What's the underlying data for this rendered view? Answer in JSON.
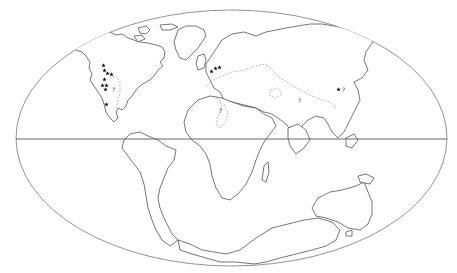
{
  "map": {
    "type": "paleogeographic world map",
    "projection": "elliptical (equal-area style)",
    "features": {
      "equator": "Equator line",
      "coastlines": "continental outlines",
      "dashed_lines": "inferred ancient shorelines / epicontinental seaways"
    },
    "colors": {
      "background": "#ffffff",
      "coastline": "#3a3a3a",
      "frame": "#777777",
      "dashed_shoreline": "#8a8a8a",
      "marker": "#111111"
    },
    "marker_symbol": "star",
    "uncertain_label": "?",
    "localities": [
      {
        "region": "western North America",
        "count": 9
      },
      {
        "region": "western Europe",
        "count": 3
      },
      {
        "region": "eastern Asia",
        "count": 1,
        "uncertain": true
      }
    ],
    "question_marks": [
      {
        "region": "western interior North America",
        "text": "?"
      },
      {
        "region": "northern Africa",
        "text": "?"
      },
      {
        "region": "central Asia",
        "text": "?"
      },
      {
        "region": "eastern Asia",
        "text": "?"
      }
    ]
  }
}
